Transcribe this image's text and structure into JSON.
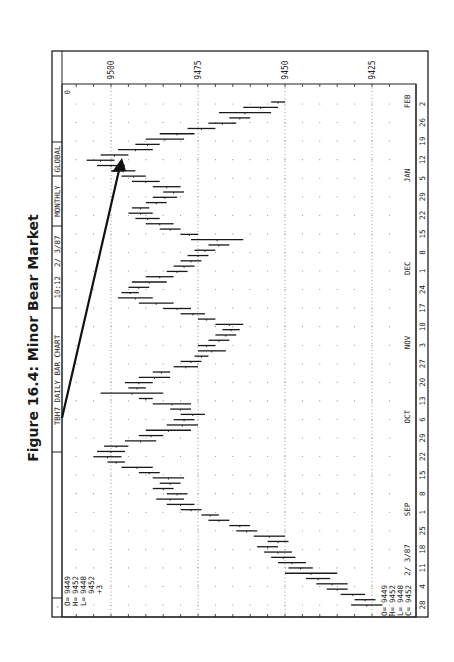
{
  "figure": {
    "title": "Figure 16.4: Minor Bear Market"
  },
  "header": {
    "symbol_label": "TBH7 DAILY BAR CHART",
    "time_label": "10:12  2/ 3/87",
    "period_label": "MONTHLY",
    "scope_label": "GLOBAL",
    "corner_label": "0"
  },
  "ohlc_top": {
    "O": "9449",
    "H": "9452",
    "L": "9448",
    "C": "9452",
    "change": "+3"
  },
  "ohlc_bottom": {
    "O": "9449",
    "H": "9452",
    "L": "9448",
    "C": "9452"
  },
  "colors": {
    "ink": "#222222",
    "grid": "#888888",
    "background": "#ffffff"
  },
  "chart_data": {
    "type": "bar",
    "subtype": "ohlc-daily-range",
    "title": "Figure 16.4: Minor Bear Market",
    "chart_label": "TBH7 DAILY BAR CHART",
    "orientation_note": "page rotated 90° counter-clockwise",
    "xlabel": "Date (Aug 1986 – Feb 1987)",
    "ylabel": "Price",
    "ylim": [
      9420,
      9510
    ],
    "y_ticks": [
      9500,
      9475,
      9450,
      9425
    ],
    "month_labels": [
      "SEP",
      "OCT",
      "NOV",
      "DEC",
      "JAN",
      "FEB"
    ],
    "week_labels": [
      "28",
      "4",
      "11",
      "18",
      "25",
      "1",
      "8",
      "15",
      "22",
      "29",
      "6",
      "13",
      "20",
      "27",
      "3",
      "10",
      "17",
      "24",
      "1",
      "8",
      "15",
      "22",
      "29",
      "5",
      "12",
      "19",
      "26",
      "2"
    ],
    "date_stamp": "2/ 3/87",
    "annotation": "Arrow marking rise from late-September low area to January high",
    "grid": true,
    "bars": [
      {
        "t": 0,
        "low": 9431,
        "high": 9422
      },
      {
        "t": 1,
        "low": 9430,
        "high": 9424
      },
      {
        "t": 2,
        "low": 9434,
        "high": 9427
      },
      {
        "t": 3,
        "low": 9438,
        "high": 9432
      },
      {
        "t": 4,
        "low": 9441,
        "high": 9432
      },
      {
        "t": 5,
        "low": 9444,
        "high": 9437
      },
      {
        "t": 6,
        "low": 9450,
        "high": 9435
      },
      {
        "t": 7,
        "low": 9449,
        "high": 9442
      },
      {
        "t": 8,
        "low": 9452,
        "high": 9444
      },
      {
        "t": 9,
        "low": 9454,
        "high": 9447
      },
      {
        "t": 10,
        "low": 9456,
        "high": 9448
      },
      {
        "t": 11,
        "low": 9458,
        "high": 9452
      },
      {
        "t": 12,
        "low": 9455,
        "high": 9449
      },
      {
        "t": 13,
        "low": 9459,
        "high": 9450
      },
      {
        "t": 14,
        "low": 9464,
        "high": 9458
      },
      {
        "t": 15,
        "low": 9466,
        "high": 9460
      },
      {
        "t": 16,
        "low": 9472,
        "high": 9466
      },
      {
        "t": 17,
        "low": 9474,
        "high": 9469
      },
      {
        "t": 18,
        "low": 9480,
        "high": 9474
      },
      {
        "t": 19,
        "low": 9484,
        "high": 9476
      },
      {
        "t": 20,
        "low": 9487,
        "high": 9479
      },
      {
        "t": 21,
        "low": 9484,
        "high": 9478
      },
      {
        "t": 22,
        "low": 9488,
        "high": 9482
      },
      {
        "t": 23,
        "low": 9486,
        "high": 9480
      },
      {
        "t": 24,
        "low": 9488,
        "high": 9479
      },
      {
        "t": 25,
        "low": 9492,
        "high": 9486
      },
      {
        "t": 26,
        "low": 9497,
        "high": 9488
      },
      {
        "t": 27,
        "low": 9501,
        "high": 9496
      },
      {
        "t": 28,
        "low": 9505,
        "high": 9497
      },
      {
        "t": 29,
        "low": 9504,
        "high": 9496
      },
      {
        "t": 30,
        "low": 9502,
        "high": 9495
      },
      {
        "t": 31,
        "low": 9496,
        "high": 9487
      },
      {
        "t": 32,
        "low": 9492,
        "high": 9485
      },
      {
        "t": 33,
        "low": 9490,
        "high": 9477
      },
      {
        "t": 34,
        "low": 9484,
        "high": 9475
      },
      {
        "t": 35,
        "low": 9482,
        "high": 9476
      },
      {
        "t": 36,
        "low": 9480,
        "high": 9473
      },
      {
        "t": 37,
        "low": 9483,
        "high": 9477
      },
      {
        "t": 38,
        "low": 9488,
        "high": 9477
      },
      {
        "t": 39,
        "low": 9492,
        "high": 9488
      },
      {
        "t": 40,
        "low": 9503,
        "high": 9485
      },
      {
        "t": 41,
        "low": 9495,
        "high": 9490
      },
      {
        "t": 42,
        "low": 9496,
        "high": 9488
      },
      {
        "t": 43,
        "low": 9492,
        "high": 9483
      },
      {
        "t": 44,
        "low": 9488,
        "high": 9483
      },
      {
        "t": 45,
        "low": 9482,
        "high": 9475
      },
      {
        "t": 46,
        "low": 9480,
        "high": 9474
      },
      {
        "t": 47,
        "low": 9476,
        "high": 9472
      },
      {
        "t": 48,
        "low": 9475,
        "high": 9467
      },
      {
        "t": 49,
        "low": 9475,
        "high": 9470
      },
      {
        "t": 50,
        "low": 9472,
        "high": 9466
      },
      {
        "t": 51,
        "low": 9470,
        "high": 9464
      },
      {
        "t": 52,
        "low": 9468,
        "high": 9463
      },
      {
        "t": 53,
        "low": 9470,
        "high": 9462
      },
      {
        "t": 54,
        "low": 9475,
        "high": 9470
      },
      {
        "t": 55,
        "low": 9480,
        "high": 9473
      },
      {
        "t": 56,
        "low": 9485,
        "high": 9477
      },
      {
        "t": 57,
        "low": 9492,
        "high": 9482
      },
      {
        "t": 58,
        "low": 9498,
        "high": 9488
      },
      {
        "t": 59,
        "low": 9497,
        "high": 9492
      },
      {
        "t": 60,
        "low": 9495,
        "high": 9489
      },
      {
        "t": 61,
        "low": 9494,
        "high": 9484
      },
      {
        "t": 62,
        "low": 9490,
        "high": 9482
      },
      {
        "t": 63,
        "low": 9484,
        "high": 9478
      },
      {
        "t": 64,
        "low": 9482,
        "high": 9476
      },
      {
        "t": 65,
        "low": 9480,
        "high": 9474
      },
      {
        "t": 66,
        "low": 9478,
        "high": 9472
      },
      {
        "t": 67,
        "low": 9476,
        "high": 9470
      },
      {
        "t": 68,
        "low": 9472,
        "high": 9466
      },
      {
        "t": 69,
        "low": 9477,
        "high": 9462
      },
      {
        "t": 70,
        "low": 9480,
        "high": 9475
      },
      {
        "t": 71,
        "low": 9486,
        "high": 9480
      },
      {
        "t": 72,
        "low": 9490,
        "high": 9482
      },
      {
        "t": 73,
        "low": 9493,
        "high": 9486
      },
      {
        "t": 74,
        "low": 9495,
        "high": 9488
      },
      {
        "t": 75,
        "low": 9494,
        "high": 9489
      },
      {
        "t": 76,
        "low": 9490,
        "high": 9484
      },
      {
        "t": 77,
        "low": 9488,
        "high": 9481
      },
      {
        "t": 78,
        "low": 9485,
        "high": 9479
      },
      {
        "t": 79,
        "low": 9488,
        "high": 9480
      },
      {
        "t": 80,
        "low": 9494,
        "high": 9486
      },
      {
        "t": 81,
        "low": 9497,
        "high": 9490
      },
      {
        "t": 82,
        "low": 9500,
        "high": 9493
      },
      {
        "t": 83,
        "low": 9504,
        "high": 9496
      },
      {
        "t": 84,
        "low": 9507,
        "high": 9499
      },
      {
        "t": 85,
        "low": 9503,
        "high": 9495
      },
      {
        "t": 86,
        "low": 9498,
        "high": 9488
      },
      {
        "t": 87,
        "low": 9493,
        "high": 9486
      },
      {
        "t": 88,
        "low": 9490,
        "high": 9479
      },
      {
        "t": 89,
        "low": 9486,
        "high": 9476
      },
      {
        "t": 90,
        "low": 9478,
        "high": 9470
      },
      {
        "t": 91,
        "low": 9472,
        "high": 9464
      },
      {
        "t": 92,
        "low": 9466,
        "high": 9460
      },
      {
        "t": 93,
        "low": 9469,
        "high": 9454
      },
      {
        "t": 94,
        "low": 9462,
        "high": 9452
      },
      {
        "t": 95,
        "low": 9454,
        "high": 9450
      }
    ]
  }
}
